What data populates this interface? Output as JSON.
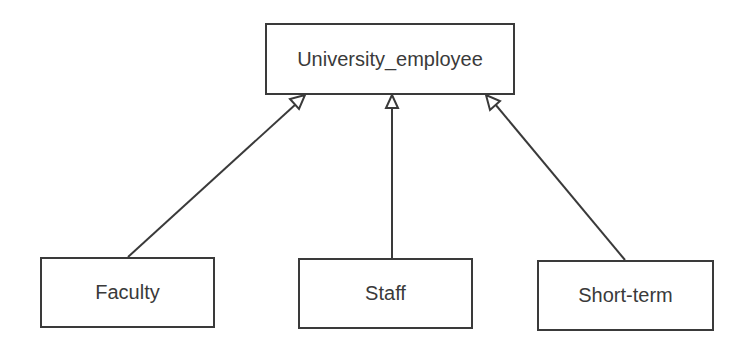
{
  "diagram": {
    "type": "uml-generalization",
    "parent": {
      "label": "University_employee"
    },
    "children": [
      {
        "label": "Faculty"
      },
      {
        "label": "Staff"
      },
      {
        "label": "Short-term"
      }
    ],
    "colors": {
      "stroke": "#3a3a3a",
      "background": "#ffffff"
    }
  }
}
